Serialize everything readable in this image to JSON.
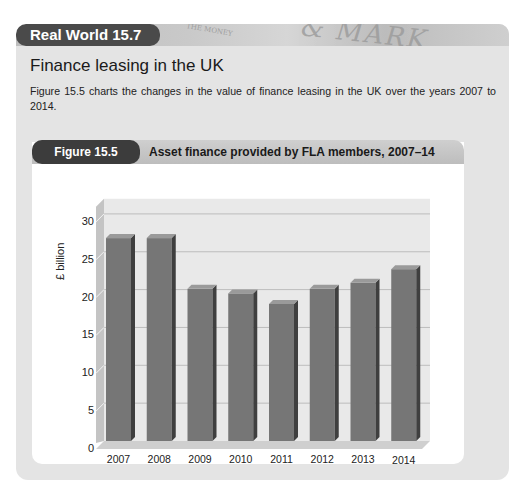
{
  "box": {
    "badge": "Real World 15.7",
    "banner_texture_text": "& MARK",
    "banner_texture_small": "THE MONEY"
  },
  "section": {
    "title": "Finance leasing in the UK",
    "intro": "Figure 15.5 charts the changes in the value of finance leasing in the UK over the years 2007 to 2014."
  },
  "figure": {
    "badge": "Figure 15.5",
    "title": "Asset finance provided by FLA members, 2007–14"
  },
  "colors": {
    "card_bg": "#e4e4e4",
    "badge_bg": "#4a4a4a",
    "bar_front": "#767676",
    "bar_side": "#3f3f3f",
    "bar_top": "#9a9a9a",
    "back_wall": "#e9e9e9",
    "side_wall": "#c4c4c4",
    "floor": "#cfcfcf"
  },
  "chart_data": {
    "type": "bar",
    "style": "3d",
    "title": "Asset finance provided by FLA members, 2007–14",
    "xlabel": "",
    "ylabel": "£ billion",
    "categories": [
      "2007",
      "2008",
      "2009",
      "2010",
      "2011",
      "2012",
      "2013",
      "2014"
    ],
    "values": [
      26.8,
      26.8,
      20.1,
      19.5,
      18.1,
      20.1,
      20.9,
      22.7
    ],
    "yticks": [
      "0",
      "5",
      "10",
      "15",
      "20",
      "25",
      "30"
    ],
    "ylim": [
      0,
      32
    ],
    "grid": true,
    "legend": null
  }
}
